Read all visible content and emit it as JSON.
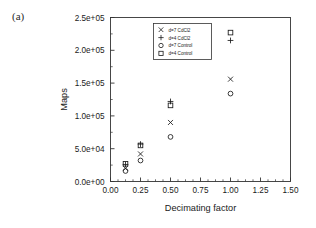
{
  "figure": {
    "panel_label": "(a)",
    "background_color": "#ffffff",
    "ink_color": "#1a1a1a"
  },
  "chart_data": {
    "type": "scatter",
    "title": "",
    "xlabel": "Decimating factor",
    "ylabel": "Maps",
    "xlim": [
      0.0,
      1.5
    ],
    "ylim": [
      0.0,
      250000
    ],
    "grid": false,
    "legend_position": "upper-center",
    "xticks": [
      0.0,
      0.25,
      0.5,
      0.75,
      1.0,
      1.25,
      1.5
    ],
    "xticklabels": [
      "0.00",
      "0.25",
      "0.50",
      "0.75",
      "1.00",
      "1.25",
      "1.50"
    ],
    "yticks": [
      0,
      50000,
      100000,
      150000,
      200000,
      250000
    ],
    "yticklabels": [
      "0.0e+00",
      "5.0e+04",
      "1.0e+05",
      "1.5e+05",
      "2.0e+05",
      "2.5e+05"
    ],
    "x_minor_ticks_per_interval": 4,
    "y_minor_ticks_per_interval": 1,
    "series": [
      {
        "name": "d=7 CdCl2",
        "marker": "x",
        "x": [
          0.125,
          0.25,
          0.5,
          1.0
        ],
        "values": [
          20000,
          42000,
          90000,
          156000
        ]
      },
      {
        "name": "d=4 CdCl2",
        "marker": "plus",
        "x": [
          0.125,
          0.25,
          0.5,
          1.0
        ],
        "values": [
          26000,
          57000,
          122000,
          215000
        ]
      },
      {
        "name": "d=7 Control",
        "marker": "circle",
        "x": [
          0.125,
          0.25,
          0.5,
          1.0
        ],
        "values": [
          16000,
          32000,
          68000,
          134000
        ]
      },
      {
        "name": "d=4 Control",
        "marker": "square",
        "x": [
          0.125,
          0.25,
          0.5,
          1.0
        ],
        "values": [
          27000,
          55000,
          116000,
          227000
        ]
      }
    ]
  }
}
